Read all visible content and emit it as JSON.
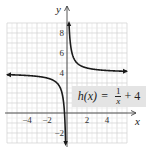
{
  "chart_data": {
    "type": "line",
    "title": "",
    "function": "h(x) = 1/x + 4",
    "label": {
      "lhs": "h(x)",
      "equals": "=",
      "numerator": "1",
      "denominator": "x",
      "tail": "+ 4"
    },
    "xlabel": "x",
    "ylabel": "y",
    "xlim": [
      -6,
      6
    ],
    "ylim": [
      -3,
      9
    ],
    "x_ticks": [
      -4,
      -2,
      2,
      4
    ],
    "x_tick_labels": [
      "−4",
      "−2",
      "2",
      "4"
    ],
    "y_ticks": [
      -2,
      4,
      6,
      8
    ],
    "y_tick_labels": [
      "−2",
      "4",
      "6",
      "8"
    ],
    "grid": true,
    "asymptotes": {
      "vertical": 0,
      "horizontal": 4
    },
    "series": [
      {
        "name": "left branch",
        "x": [
          -6,
          -4,
          -2,
          -1,
          -0.5,
          -0.3,
          -0.2,
          -0.14
        ],
        "y": [
          3.83,
          3.75,
          3.5,
          3,
          2,
          0.67,
          -1,
          -3
        ]
      },
      {
        "name": "right branch",
        "x": [
          0.2,
          0.3,
          0.5,
          1,
          2,
          4,
          6
        ],
        "y": [
          9,
          7.33,
          6,
          5,
          4.5,
          4.25,
          4.17
        ]
      }
    ]
  }
}
